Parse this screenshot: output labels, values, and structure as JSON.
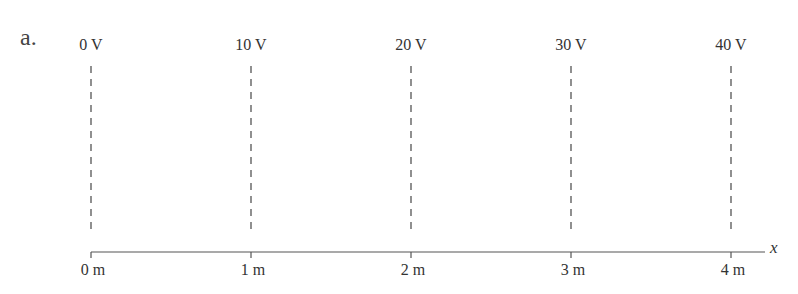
{
  "figure": {
    "part_label": "a.",
    "axis_variable": "x",
    "equipotentials": [
      {
        "label": "0 V",
        "x_px": 91
      },
      {
        "label": "10 V",
        "x_px": 251
      },
      {
        "label": "20 V",
        "x_px": 411
      },
      {
        "label": "30 V",
        "x_px": 571
      },
      {
        "label": "40 V",
        "x_px": 731
      }
    ],
    "axis_ticks": [
      {
        "label": "0 m",
        "x_px": 91
      },
      {
        "label": "1 m",
        "x_px": 251
      },
      {
        "label": "2 m",
        "x_px": 411
      },
      {
        "label": "3 m",
        "x_px": 571
      },
      {
        "label": "4 m",
        "x_px": 731
      }
    ],
    "colors": {
      "line": "#555555",
      "text": "#333333"
    }
  }
}
